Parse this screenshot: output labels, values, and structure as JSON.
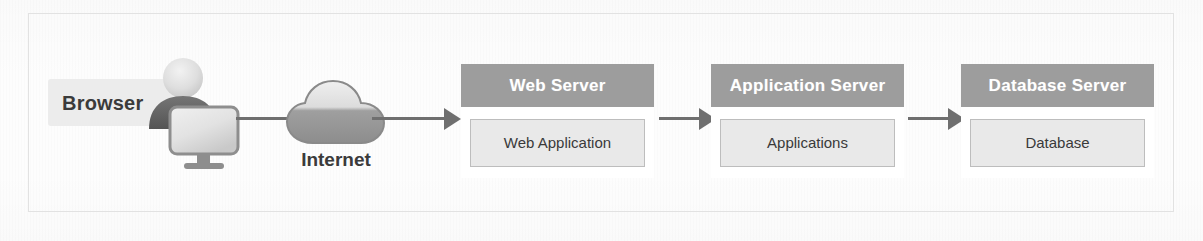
{
  "diagram": {
    "background_color": "#fdfdfd",
    "frame_border_color": "#e2e2e2",
    "client": {
      "label": "Browser",
      "label_box_color": "#ececec",
      "icons": {
        "user": "user-icon",
        "monitor": "monitor-icon"
      }
    },
    "network": {
      "label": "Internet",
      "icon": "cloud-icon"
    },
    "connectors": [
      {
        "name": "browser-to-internet",
        "style": "line",
        "direction": "right"
      },
      {
        "name": "internet-to-web-server",
        "style": "arrow",
        "direction": "right"
      },
      {
        "name": "web-server-to-application-server",
        "style": "arrow",
        "direction": "right"
      },
      {
        "name": "application-server-to-database-server",
        "style": "arrow",
        "direction": "right"
      }
    ],
    "tiers": [
      {
        "header": "Web Server",
        "component": "Web Application",
        "header_color": "#9d9d9d",
        "component_color": "#e9e9e9"
      },
      {
        "header": "Application Server",
        "component": "Applications",
        "header_color": "#9d9d9d",
        "component_color": "#e9e9e9"
      },
      {
        "header": "Database Server",
        "component": "Database",
        "header_color": "#9d9d9d",
        "component_color": "#e9e9e9"
      }
    ]
  }
}
